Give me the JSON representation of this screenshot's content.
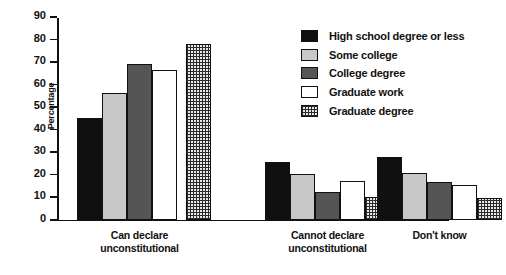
{
  "chart_data": {
    "type": "bar",
    "title": "",
    "xlabel": "",
    "ylabel": "Percentage",
    "ylim": [
      0,
      90
    ],
    "yticks": [
      0,
      10,
      20,
      30,
      40,
      50,
      60,
      70,
      80,
      90
    ],
    "grid": false,
    "legend_position": "top-right",
    "categories": [
      "Can declare\nunconstitutional",
      "Cannot declare\nunconstitutional",
      "Don't know"
    ],
    "series": [
      {
        "name": "High school degree or less",
        "swatch": "black",
        "color": "#101010",
        "values": [
          45,
          25.5,
          27.5
        ]
      },
      {
        "name": "Some college",
        "swatch": "lightgray",
        "color": "#c8c8c8",
        "values": [
          56,
          20,
          20.5
        ]
      },
      {
        "name": "College degree",
        "swatch": "darkgray",
        "color": "#555555",
        "values": [
          69,
          12,
          16.5
        ]
      },
      {
        "name": "Graduate work",
        "swatch": "white",
        "color": "#ffffff",
        "values": [
          66.5,
          17,
          15.5
        ]
      },
      {
        "name": "Graduate degree",
        "swatch": "crosshatch",
        "color": "#e8e8e8",
        "values": [
          78,
          10,
          9.5
        ]
      }
    ]
  }
}
